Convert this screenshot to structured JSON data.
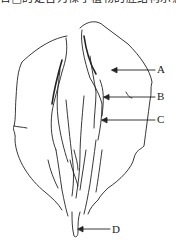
{
  "caption": "台□的是否为裸子植物的胚结构示意图",
  "labels": [
    {
      "id": "A",
      "text": "A"
    },
    {
      "id": "B",
      "text": "B"
    },
    {
      "id": "C",
      "text": "C"
    },
    {
      "id": "D",
      "text": "D"
    }
  ],
  "colors": {
    "line": "#222222",
    "background": "#ffffff"
  }
}
